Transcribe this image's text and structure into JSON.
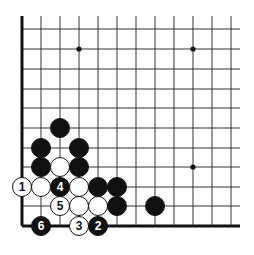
{
  "diagram": {
    "type": "go-board-corner",
    "corner": "bottom-left",
    "grid": {
      "columns_x": [
        22,
        41,
        60,
        79,
        98,
        117,
        136,
        155,
        174,
        193,
        212,
        231
      ],
      "rows_y": [
        29,
        49,
        69,
        89,
        108,
        128,
        148,
        167,
        187,
        206,
        226
      ],
      "top_extent": 16,
      "right_extent": 240,
      "line_color": "#333333",
      "edge_color": "#111111"
    },
    "star_points": [
      {
        "x": 79,
        "y": 49
      },
      {
        "x": 193,
        "y": 49
      },
      {
        "x": 193,
        "y": 167
      }
    ],
    "stones": [
      {
        "color": "black",
        "x": 60,
        "y": 128,
        "label": ""
      },
      {
        "color": "black",
        "x": 41,
        "y": 148,
        "label": ""
      },
      {
        "color": "black",
        "x": 79,
        "y": 148,
        "label": ""
      },
      {
        "color": "black",
        "x": 41,
        "y": 167,
        "label": ""
      },
      {
        "color": "white",
        "x": 60,
        "y": 167,
        "label": ""
      },
      {
        "color": "black",
        "x": 79,
        "y": 167,
        "label": ""
      },
      {
        "color": "white",
        "x": 22,
        "y": 187,
        "label": "1"
      },
      {
        "color": "white",
        "x": 41,
        "y": 187,
        "label": ""
      },
      {
        "color": "black",
        "x": 60,
        "y": 187,
        "label": "4"
      },
      {
        "color": "white",
        "x": 79,
        "y": 187,
        "label": ""
      },
      {
        "color": "black",
        "x": 98,
        "y": 187,
        "label": ""
      },
      {
        "color": "black",
        "x": 117,
        "y": 187,
        "label": ""
      },
      {
        "color": "white",
        "x": 60,
        "y": 206,
        "label": "5"
      },
      {
        "color": "white",
        "x": 79,
        "y": 206,
        "label": ""
      },
      {
        "color": "white",
        "x": 98,
        "y": 206,
        "label": ""
      },
      {
        "color": "black",
        "x": 117,
        "y": 206,
        "label": ""
      },
      {
        "color": "black",
        "x": 155,
        "y": 206,
        "label": ""
      },
      {
        "color": "black",
        "x": 41,
        "y": 226,
        "label": "6"
      },
      {
        "color": "white",
        "x": 79,
        "y": 226,
        "label": "3"
      },
      {
        "color": "black",
        "x": 98,
        "y": 226,
        "label": "2"
      }
    ],
    "stone_radius": 9.5
  }
}
